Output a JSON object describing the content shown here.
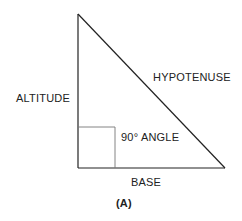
{
  "diagram": {
    "type": "right-triangle",
    "labels": {
      "altitude": "ALTITUDE",
      "hypotenuse": "HYPOTENUSE",
      "angle": "90° ANGLE",
      "base": "BASE",
      "caption": "(A)"
    },
    "colors": {
      "stroke": "#222222",
      "right_angle_marker": "#777777",
      "text": "#222222"
    }
  }
}
